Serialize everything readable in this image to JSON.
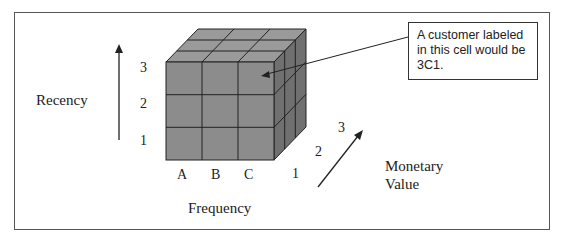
{
  "diagram": {
    "axes": {
      "recency": {
        "title": "Recency",
        "ticks": [
          "1",
          "2",
          "3"
        ]
      },
      "frequency": {
        "title": "Frequency",
        "ticks": [
          "A",
          "B",
          "C"
        ]
      },
      "monetary": {
        "title_line1": "Monetary",
        "title_line2": "Value",
        "ticks": [
          "1",
          "2",
          "3"
        ]
      }
    },
    "callout": {
      "text": "A customer labeled in this cell would be 3C1.",
      "target_cell": "3C1"
    },
    "colors": {
      "cube_front": "#8c8c8c",
      "cube_top": "#9a9a9a",
      "cube_side": "#6f6f6f",
      "grid_line": "#222222",
      "frame": "#555555"
    }
  }
}
